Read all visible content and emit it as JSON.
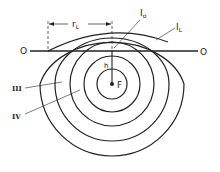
{
  "diagram": {
    "labels": {
      "rL": "r",
      "rL_sub": "L",
      "I0": "I",
      "I0_sub": "o",
      "IL": "I",
      "IL_sub": "L",
      "O_left": "O",
      "O_right": "O",
      "h": "h",
      "F": "F",
      "zone3": "III",
      "zone4": "IV"
    },
    "colors": {
      "stroke": "#222222",
      "background": "#ffffff"
    }
  }
}
